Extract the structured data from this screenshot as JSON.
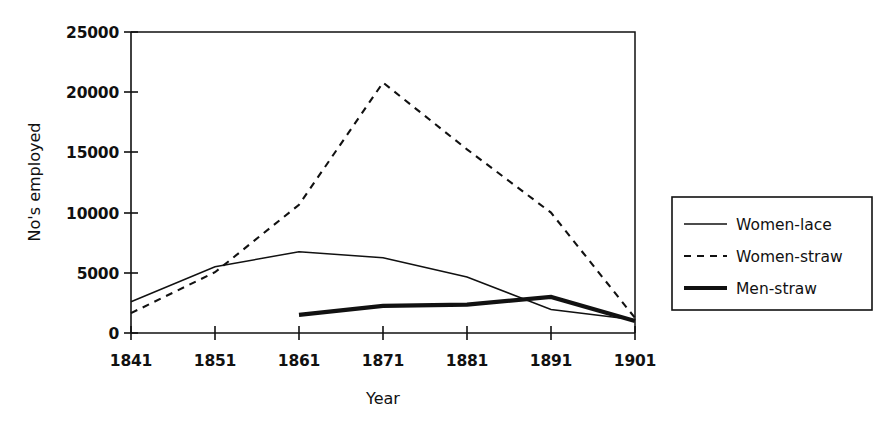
{
  "chart_data": {
    "type": "line",
    "title": "",
    "xlabel": "Year",
    "ylabel": "No's employed",
    "x": [
      1841,
      1851,
      1861,
      1871,
      1881,
      1891,
      1901
    ],
    "xtick_labels": [
      "1841",
      "1851",
      "1861",
      "1871",
      "1881",
      "1891",
      "1901"
    ],
    "ytick_labels": [
      "0",
      "5000",
      "10000",
      "15000",
      "20000",
      "25000"
    ],
    "yticks": [
      0,
      5000,
      10000,
      15000,
      20000,
      25000
    ],
    "xlim": [
      1841,
      1901
    ],
    "ylim": [
      0,
      25000
    ],
    "grid": false,
    "legend_position": "right",
    "series": [
      {
        "name": "Women-lace",
        "style": "solid-thin",
        "x": [
          1841,
          1851,
          1861,
          1871,
          1881,
          1891,
          1901
        ],
        "values": [
          2600,
          5500,
          6750,
          6250,
          4650,
          1950,
          1100
        ]
      },
      {
        "name": "Women-straw",
        "style": "dashed",
        "x": [
          1841,
          1851,
          1861,
          1871,
          1881,
          1891,
          1901
        ],
        "values": [
          1650,
          5050,
          10650,
          20800,
          15250,
          10000,
          1250
        ]
      },
      {
        "name": "Men-straw",
        "style": "solid-thick",
        "x": [
          1861,
          1871,
          1881,
          1891,
          1901
        ],
        "values": [
          1500,
          2250,
          2350,
          3000,
          1000
        ]
      }
    ]
  },
  "legend": {
    "entries": [
      {
        "label": "Women-lace",
        "swatch": "thin-solid-line-icon"
      },
      {
        "label": "Women-straw",
        "swatch": "dashed-line-icon"
      },
      {
        "label": "Men-straw",
        "swatch": "thick-solid-line-icon"
      }
    ]
  },
  "axes": {
    "y_title": "No's employed",
    "x_title": "Year",
    "y_labels": [
      "25000",
      "20000",
      "15000",
      "10000",
      "5000",
      "0"
    ],
    "x_labels": [
      "1841",
      "1851",
      "1861",
      "1871",
      "1881",
      "1891",
      "1901"
    ]
  }
}
